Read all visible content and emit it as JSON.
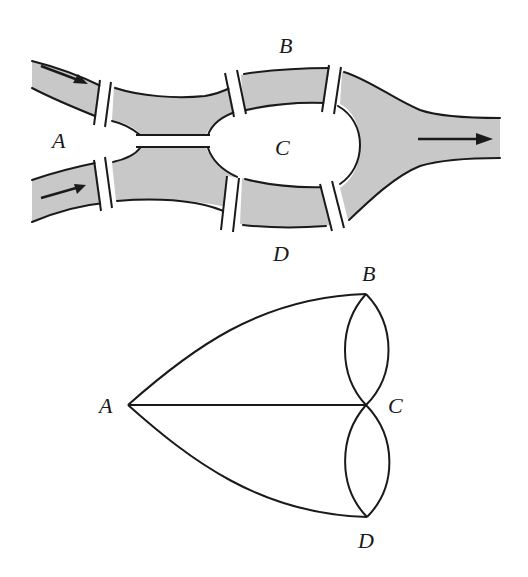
{
  "figure": {
    "map": {
      "labels": {
        "A": "A",
        "B": "B",
        "C": "C",
        "D": "D"
      },
      "bridge_count": 7,
      "flow_arrows": 3,
      "colors": {
        "water": "#c8c8c8",
        "ink": "#1a1a1a",
        "land": "#ffffff"
      }
    },
    "graph": {
      "labels": {
        "A": "A",
        "B": "B",
        "C": "C",
        "D": "D"
      },
      "nodes": [
        {
          "id": "A",
          "x": 128,
          "y": 405
        },
        {
          "id": "B",
          "x": 366,
          "y": 294
        },
        {
          "id": "C",
          "x": 366,
          "y": 405
        },
        {
          "id": "D",
          "x": 367,
          "y": 517
        }
      ],
      "edges": [
        [
          "A",
          "B"
        ],
        [
          "A",
          "C"
        ],
        [
          "A",
          "D"
        ],
        [
          "B",
          "C"
        ],
        [
          "B",
          "C"
        ],
        [
          "C",
          "D"
        ],
        [
          "C",
          "D"
        ]
      ]
    }
  }
}
